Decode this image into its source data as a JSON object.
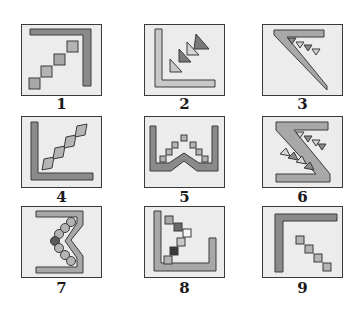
{
  "figure": {
    "panels": [
      {
        "id": 1,
        "label": "1",
        "description": "Dark inverted-L bar at top-right with 4 ascending squares staircase"
      },
      {
        "id": 2,
        "label": "2",
        "description": "Light L bar bottom-left with 3 ascending triangles alternating shades"
      },
      {
        "id": 3,
        "label": "3",
        "description": "Diagonal bar from top-left to bottom-right with 4 small downward triangles"
      },
      {
        "id": 4,
        "label": "4",
        "description": "Dark L bar bottom-left with 4 ascending tilted squares"
      },
      {
        "id": 5,
        "label": "5",
        "description": "U-shaped bar with central peak and 7 squares forming a pyramid"
      },
      {
        "id": 6,
        "label": "6",
        "description": "Z-shaped bar with two rows of triangles on diagonals"
      },
      {
        "id": 7,
        "label": "7",
        "description": "Bracket shape with inward chevron and 7 circles along curve, one dark"
      },
      {
        "id": 8,
        "label": "8",
        "description": "U-shaped bar with 6 squares in a chevron path, varying shades"
      },
      {
        "id": 9,
        "label": "9",
        "description": "Dark inverted-L bar at top-left with 4 descending squares"
      }
    ]
  },
  "colors": {
    "panel_bg": "#ececec",
    "border": "#3a3a3a",
    "dark_gray": "#8a8a8a",
    "mid_gray": "#a8a8a8",
    "light_gray": "#c8c8c8",
    "very_dark": "#4a4a4a",
    "white": "#f6f6f6"
  }
}
